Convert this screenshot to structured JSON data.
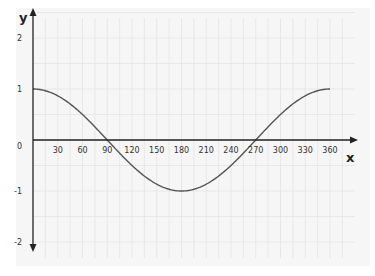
{
  "chart_data": {
    "type": "line",
    "title": "",
    "xlabel": "x",
    "ylabel": "y",
    "xlim": [
      0,
      360
    ],
    "ylim": [
      -2,
      2
    ],
    "x_ticks": [
      30,
      60,
      90,
      120,
      150,
      180,
      210,
      240,
      270,
      300,
      330,
      360
    ],
    "x_tick_labels": [
      "30",
      "60",
      "90",
      "120",
      "150",
      "180",
      "210",
      "240",
      "270",
      "300",
      "330",
      "360"
    ],
    "y_ticks": [
      2,
      1,
      0,
      -1,
      -2
    ],
    "y_tick_labels": [
      "2",
      "1",
      "0",
      "-1",
      "-2"
    ],
    "grid": true,
    "series": [
      {
        "name": "y = cos x",
        "function": "cos",
        "x": [
          0,
          30,
          60,
          90,
          120,
          150,
          180,
          210,
          240,
          270,
          300,
          330,
          360
        ],
        "y": [
          1,
          0.87,
          0.5,
          0,
          -0.5,
          -0.87,
          -1,
          -0.87,
          -0.5,
          0,
          0.5,
          0.87,
          1
        ],
        "color": "#555555"
      }
    ]
  },
  "colors": {
    "background_panel": "#f4f4f4",
    "grid": "#e2e2e2",
    "axis": "#222222",
    "curve": "#555555"
  }
}
